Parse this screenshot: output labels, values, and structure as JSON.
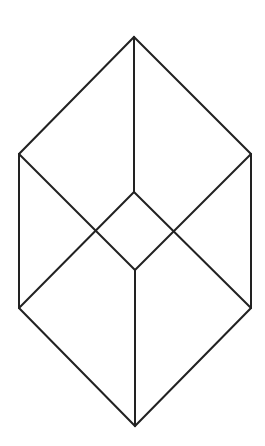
{
  "figure": {
    "stroke_color": "#222222",
    "background_color": "#ffffff",
    "vertices": {
      "top": [
        134,
        37
      ],
      "right_upper": [
        251,
        154
      ],
      "right_lower": [
        251,
        308
      ],
      "bottom": [
        135,
        426
      ],
      "left_lower": [
        19,
        308
      ],
      "left_upper": [
        19,
        154
      ],
      "inner_top": [
        134,
        192
      ],
      "inner_bottom": [
        135,
        270
      ]
    },
    "segments": [
      {
        "name": "top-to-inner-top",
        "from": "top",
        "to": "inner_top"
      },
      {
        "name": "inner-bottom-to-bottom",
        "from": "inner_bottom",
        "to": "bottom"
      },
      {
        "name": "left-upper-to-inner-bottom",
        "from": "left_upper",
        "to": "inner_bottom"
      },
      {
        "name": "right-upper-to-inner-bottom",
        "from": "right_upper",
        "to": "inner_bottom"
      },
      {
        "name": "inner-top-to-left-lower",
        "from": "inner_top",
        "to": "left_lower"
      },
      {
        "name": "inner-top-to-right-lower",
        "from": "inner_top",
        "to": "right_lower"
      }
    ]
  }
}
